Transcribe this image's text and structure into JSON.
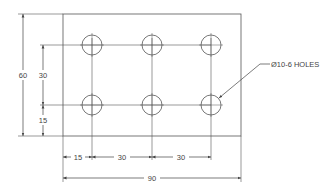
{
  "drawing": {
    "title": "Plate with 6 holes",
    "colors": {
      "line": "#555555",
      "background": "#ffffff",
      "text": "#444444"
    },
    "plate": {
      "width_mm": 90,
      "height_mm": 60
    },
    "holes": {
      "count": 6,
      "diameter_mm": 10,
      "rows": 2,
      "cols": 3,
      "pitch_x_mm": 30,
      "pitch_y_mm": 30,
      "offset_x_mm": 15,
      "offset_y_mm": 15
    },
    "dimensions": {
      "overall_height": "60",
      "hole_pitch_vertical": "30",
      "bottom_offset": "15",
      "left_offset": "15",
      "pitch_x_1": "30",
      "pitch_x_2": "30",
      "overall_width": "90"
    },
    "callout": "Ø10-6 HOLES"
  }
}
